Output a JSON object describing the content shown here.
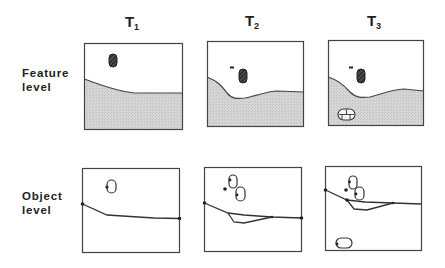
{
  "columns": [
    {
      "label": "T",
      "sub": "1"
    },
    {
      "label": "T",
      "sub": "2"
    },
    {
      "label": "T",
      "sub": "3"
    }
  ],
  "rows": [
    {
      "line1": "Feature",
      "line2": "level"
    },
    {
      "line1": "Object",
      "line2": "level"
    }
  ],
  "colors": {
    "ground_fill": "#d4d4d4",
    "stroke": "#333333",
    "object_fill": "#3a3a3a"
  }
}
